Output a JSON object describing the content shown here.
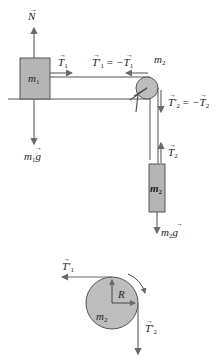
{
  "diagram": {
    "colors": {
      "block_fill": "#b5b5b5",
      "pulley_fill": "#bdbdbd",
      "line": "#555555",
      "arrow": "#6a6a6a",
      "text": "#222222"
    },
    "block1": {
      "label": "m",
      "sub": "1"
    },
    "block2": {
      "label": "m",
      "sub": "2"
    },
    "pulley": {
      "label": "m",
      "sub": "2"
    },
    "forces": {
      "normal": {
        "label": "N",
        "arrow": "→"
      },
      "weight1": {
        "label": "m",
        "sub": "1",
        "vec": "g"
      },
      "tension1": {
        "label": "T",
        "sub": "1"
      },
      "tension1_prime": {
        "label": "T'",
        "sub": "1",
        "eq": "= −",
        "rhs": "T",
        "rhs_sub": "1"
      },
      "tension2_prime": {
        "label": "T'",
        "sub": "2",
        "eq": "= −",
        "rhs": "T",
        "rhs_sub": "2"
      },
      "tension2": {
        "label": "T",
        "sub": "2"
      },
      "weight2": {
        "label": "m",
        "sub": "2",
        "vec": "g"
      }
    },
    "pulley_detail": {
      "label": "m",
      "sub": "2",
      "radius_label": "R",
      "t1_prime": {
        "label": "T'",
        "sub": "1"
      },
      "t2_prime": {
        "label": "T'",
        "sub": "2"
      },
      "rotation": "clockwise"
    }
  }
}
